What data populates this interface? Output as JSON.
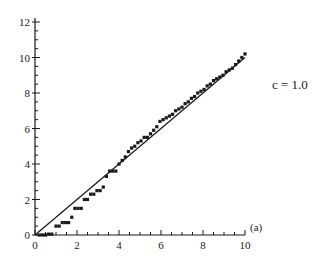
{
  "chart_data": {
    "type": "scatter",
    "title": "",
    "xlabel": "",
    "ylabel": "",
    "xlim": [
      0,
      10
    ],
    "ylim": [
      0,
      12
    ],
    "x_ticks": [
      0,
      2,
      4,
      6,
      8,
      10
    ],
    "y_ticks": [
      0,
      2,
      4,
      6,
      8,
      10,
      12
    ],
    "grid": false,
    "legend": null,
    "annotations": [
      {
        "text": "c = 1.0",
        "position": "right of plot, near y=8.5"
      },
      {
        "text": "(a)",
        "position": "right end of x-axis"
      }
    ],
    "series": [
      {
        "name": "reference line",
        "type": "line",
        "x": [
          0,
          10
        ],
        "y": [
          0,
          10
        ]
      },
      {
        "name": "data points",
        "type": "scatter",
        "marker": "square",
        "x": [
          0.2,
          0.35,
          0.5,
          0.65,
          0.8,
          1.0,
          1.15,
          1.3,
          1.45,
          1.6,
          1.75,
          1.9,
          2.05,
          2.2,
          2.35,
          2.5,
          2.65,
          2.8,
          2.95,
          3.1,
          3.25,
          3.4,
          3.55,
          3.7,
          3.85,
          4.0,
          4.15,
          4.3,
          4.45,
          4.6,
          4.75,
          4.9,
          5.05,
          5.2,
          5.35,
          5.5,
          5.65,
          5.8,
          5.95,
          6.1,
          6.25,
          6.4,
          6.55,
          6.7,
          6.85,
          7.0,
          7.15,
          7.3,
          7.45,
          7.6,
          7.75,
          7.9,
          8.05,
          8.2,
          8.35,
          8.5,
          8.65,
          8.8,
          8.95,
          9.1,
          9.25,
          9.4,
          9.55,
          9.7,
          9.85,
          10.0
        ],
        "y": [
          0.0,
          0.0,
          0.0,
          0.05,
          0.05,
          0.5,
          0.5,
          0.7,
          0.7,
          0.7,
          1.0,
          1.5,
          1.5,
          1.5,
          2.0,
          2.0,
          2.3,
          2.3,
          2.5,
          2.5,
          2.7,
          3.3,
          3.6,
          3.6,
          3.6,
          4.0,
          4.2,
          4.4,
          4.7,
          4.9,
          5.0,
          5.2,
          5.3,
          5.5,
          5.5,
          5.7,
          5.9,
          6.1,
          6.4,
          6.5,
          6.6,
          6.7,
          6.8,
          7.0,
          7.1,
          7.2,
          7.4,
          7.5,
          7.7,
          7.8,
          8.0,
          8.1,
          8.2,
          8.4,
          8.5,
          8.7,
          8.8,
          8.9,
          9.0,
          9.2,
          9.3,
          9.4,
          9.6,
          9.8,
          10.0,
          10.2
        ]
      }
    ]
  },
  "labels": {
    "annotation": "c = 1.0",
    "panel": "(a)"
  },
  "style": {
    "ink": "#1a1a1a",
    "background": "#ffffff"
  }
}
